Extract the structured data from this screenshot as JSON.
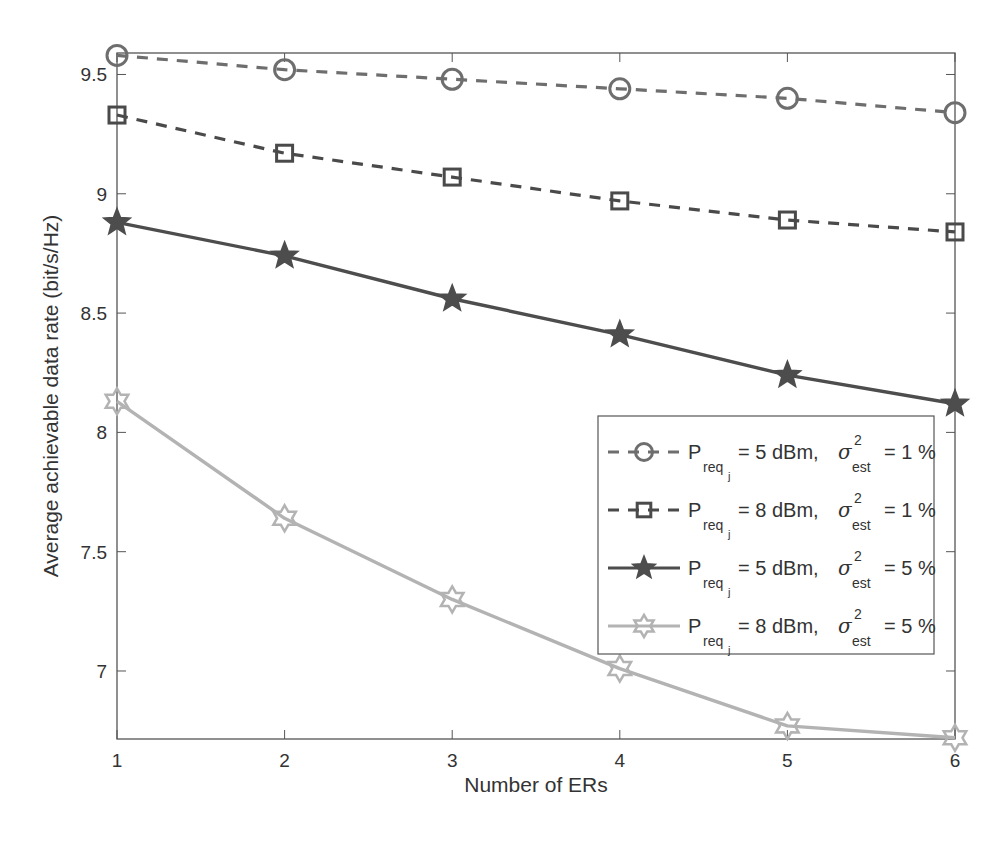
{
  "chart_data": {
    "type": "line",
    "title": "",
    "xlabel": "Number of ERs",
    "ylabel": "Average achievable data rate (bit/s/Hz)",
    "x": [
      1,
      2,
      3,
      4,
      5,
      6
    ],
    "xlim": [
      1,
      6
    ],
    "ylim": [
      6.715,
      9.59
    ],
    "xticks": [
      "1",
      "2",
      "3",
      "4",
      "5",
      "6"
    ],
    "yticks": [
      7,
      7.5,
      8,
      8.5,
      9,
      9.5
    ],
    "ytick_labels": [
      "7",
      "7.5",
      "8",
      "8.5",
      "9",
      "9.5"
    ],
    "grid": false,
    "legend_position": "center-right",
    "series": [
      {
        "name": "P_req_j = 5 dBm, σ²_est = 1 %",
        "legend": {
          "p_value": "= 5 dBm,",
          "sigma_value": "= 1 %"
        },
        "values": [
          9.58,
          9.52,
          9.48,
          9.44,
          9.4,
          9.34
        ],
        "marker": "circle",
        "line_style": "dashed",
        "color": "#6e6e6e"
      },
      {
        "name": "P_req_j = 8 dBm, σ²_est = 1 %",
        "legend": {
          "p_value": "= 8 dBm,",
          "sigma_value": "= 1 %"
        },
        "values": [
          9.33,
          9.17,
          9.07,
          8.97,
          8.89,
          8.84
        ],
        "marker": "square",
        "line_style": "dashed",
        "color": "#4a4a4a"
      },
      {
        "name": "P_req_j = 5 dBm, σ²_est = 5 %",
        "legend": {
          "p_value": "= 5 dBm,",
          "sigma_value": "= 5 %"
        },
        "values": [
          8.88,
          8.74,
          8.56,
          8.41,
          8.24,
          8.12
        ],
        "marker": "pentagram",
        "line_style": "solid",
        "color": "#4d4d4d"
      },
      {
        "name": "P_req_j = 8 dBm, σ²_est = 5 %",
        "legend": {
          "p_value": "= 8 dBm,",
          "sigma_value": "= 5 %"
        },
        "values": [
          8.13,
          7.64,
          7.3,
          7.01,
          6.77,
          6.72
        ],
        "marker": "hexagram",
        "line_style": "solid",
        "color": "#b3b3b3"
      }
    ]
  },
  "legend_labels": {
    "p_symbol": "P",
    "p_sub": "req",
    "p_subsub": "j",
    "sigma_symbol": "σ",
    "sigma_sup": "2",
    "sigma_sub": "est"
  }
}
